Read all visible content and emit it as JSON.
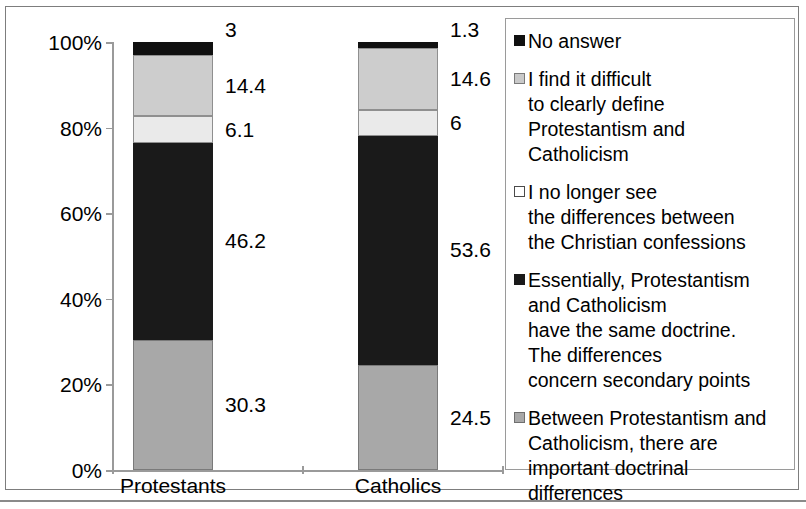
{
  "chart_data": {
    "type": "bar",
    "subtype": "stacked-100-percent",
    "title": "",
    "xlabel": "",
    "ylabel": "",
    "categories": [
      "Protestants",
      "Catholics"
    ],
    "ylim": [
      0,
      100
    ],
    "ytick_labels": [
      "0%",
      "20%",
      "40%",
      "60%",
      "80%",
      "100%"
    ],
    "ytick_values": [
      0,
      20,
      40,
      60,
      80,
      100
    ],
    "grid": false,
    "legend_position": "right",
    "stack_order": "bottom-to-top",
    "series": [
      {
        "name": "Between Protestantism and Catholicism, there are important doctrinal differences",
        "swatch": "medgray",
        "color": "#a8a8a8",
        "values": [
          30.3,
          24.5
        ],
        "labels": [
          "30.3",
          "24.5"
        ]
      },
      {
        "name": "Essentially, Protestantism and Catholicism have the same doctrine. The differences concern secondary points",
        "swatch": "dark",
        "color": "#1a1a1a",
        "values": [
          46.2,
          53.6
        ],
        "labels": [
          "46.2",
          "53.6"
        ]
      },
      {
        "name": "I no longer see the differences between the Christian confessions",
        "swatch": "white",
        "color": "#ffffff",
        "values": [
          6.1,
          6
        ],
        "labels": [
          "6.1",
          "6"
        ]
      },
      {
        "name": "I find it difficult to clearly define Protestantism and Catholicism",
        "swatch": "ltgray",
        "color": "#c9c9c9",
        "values": [
          14.4,
          14.6
        ],
        "labels": [
          "14.4",
          "14.6"
        ]
      },
      {
        "name": "No answer",
        "swatch": "black",
        "color": "#101010",
        "values": [
          3,
          1.3
        ],
        "labels": [
          "3",
          "1.3"
        ]
      }
    ]
  },
  "axis": {
    "ytick_0": "0%",
    "ytick_1": "20%",
    "ytick_2": "40%",
    "ytick_3": "60%",
    "ytick_4": "80%",
    "ytick_5": "100%",
    "cat_0": "Protestants",
    "cat_1": "Catholics"
  },
  "values": {
    "protestants": {
      "no_answer": "3",
      "difficult_define": "14.4",
      "no_longer_see": "6.1",
      "same_doctrine": "46.2",
      "important_differences": "30.3"
    },
    "catholics": {
      "no_answer": "1.3",
      "difficult_define": "14.6",
      "no_longer_see": "6",
      "same_doctrine": "53.6",
      "important_differences": "24.5"
    }
  },
  "legend": {
    "items": [
      {
        "swatch": "black",
        "lines": [
          "No answer"
        ]
      },
      {
        "swatch": "ltgray",
        "lines": [
          "I find it difficult",
          "to clearly define",
          "Protestantism and",
          "Catholicism"
        ]
      },
      {
        "swatch": "white",
        "lines": [
          "I no longer see",
          "the differences between",
          "the Christian confessions"
        ]
      },
      {
        "swatch": "dark",
        "lines": [
          "Essentially, Protestantism",
          "and Catholicism",
          "have the same doctrine.",
          "The differences",
          "concern secondary points"
        ]
      },
      {
        "swatch": "medgray",
        "lines": [
          "Between Protestantism and",
          "Catholicism, there are",
          "important doctrinal differences"
        ]
      }
    ]
  }
}
